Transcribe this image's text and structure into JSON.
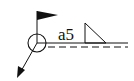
{
  "diagram": {
    "type": "welding-symbol",
    "weld_annotation": "a5",
    "weld_type": "fillet",
    "field_weld_flag": true,
    "weld_all_around": true,
    "identification_line": "dashed",
    "colors": {
      "stroke": "#111111",
      "background": "#ffffff"
    }
  }
}
